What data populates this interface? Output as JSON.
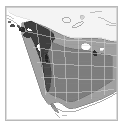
{
  "figure": {
    "type": "map-thumbnail",
    "width": 124,
    "height": 130,
    "background_color": "#ffffff",
    "frame": {
      "border_color": "#b9b9b9",
      "border_width": 1,
      "fill_color": "#ffffff"
    }
  },
  "map": {
    "title": "",
    "region": "Western North America",
    "projection": "conic",
    "style": "grayscale choropleth with administrative boundaries",
    "colors": {
      "ocean": "#ffffff",
      "land_unshaded": "#f2f2f2",
      "shade_light": "#c9c9c9",
      "shade_medium": "#9a9a9a",
      "shade_dark": "#6e6e6e",
      "shade_darkest": "#3a3a3a",
      "coastline": "#4a4a4a",
      "admin_boundary": "#d8d8d8",
      "highlight_white": "#ffffff"
    },
    "legend": {
      "present": false,
      "entries": []
    },
    "axes": {
      "ticks_visible": false,
      "tick_labels": []
    },
    "annotations": [],
    "features": {
      "coastline_label": "Pacific coastline",
      "dark_coastal_band_label": "Coastal strip (darkest shading)",
      "northern_light_area_label": "Northern unshaded region",
      "lakes_label": "Inland lakes (white)",
      "grid_label": "Administrative boundaries"
    }
  }
}
